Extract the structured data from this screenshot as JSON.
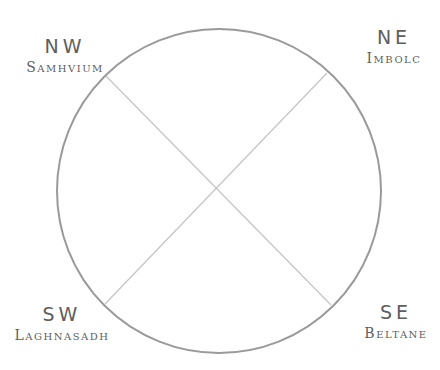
{
  "diagram": {
    "type": "wheel-of-the-year",
    "circle": {
      "cx": 219,
      "cy": 191,
      "r": 162,
      "stroke": "#9a9a9a",
      "stroke_width": 2
    },
    "diagonals": [
      {
        "from": "nw",
        "x1": 106,
        "y1": 76,
        "x2": 331,
        "y2": 305,
        "stroke": "#c4c4c4"
      },
      {
        "from": "ne",
        "x1": 327,
        "y1": 73,
        "x2": 105,
        "y2": 304,
        "stroke": "#c4c4c4"
      }
    ],
    "quadrants": {
      "nw": {
        "direction": "NW",
        "festival": "Samhvium"
      },
      "ne": {
        "direction": "NE",
        "festival": "Imbolc"
      },
      "sw": {
        "direction": "SW",
        "festival": "Laghnasadh"
      },
      "se": {
        "direction": "SE",
        "festival": "Beltane"
      }
    }
  }
}
